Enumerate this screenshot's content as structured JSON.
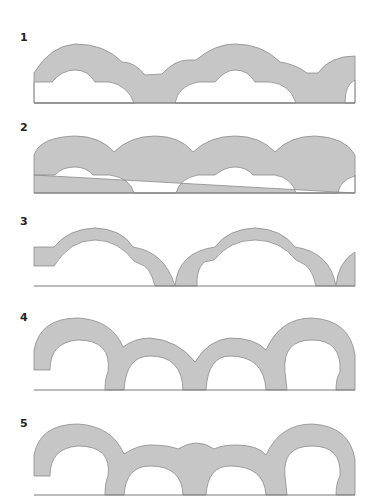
{
  "figure": {
    "colors": {
      "fill": "#c6c6c6",
      "outline": "#8c8c8c",
      "ground": "#7a7a7a",
      "label": "#222222"
    },
    "panels": [
      {
        "label": "1",
        "description": "Arcade with stepped double-curve extrados, segmental openings, short piers"
      },
      {
        "label": "2",
        "description": "Arcade with four large scalloped crowns over segmental openings"
      },
      {
        "label": "3",
        "description": "Thin cusped arches springing from ground level"
      },
      {
        "label": "4",
        "description": "Semicircular arches of alternating heights, large end arches"
      },
      {
        "label": "5",
        "description": "Semicircular arches with raised large end arches and scalloped middle crown"
      }
    ]
  }
}
